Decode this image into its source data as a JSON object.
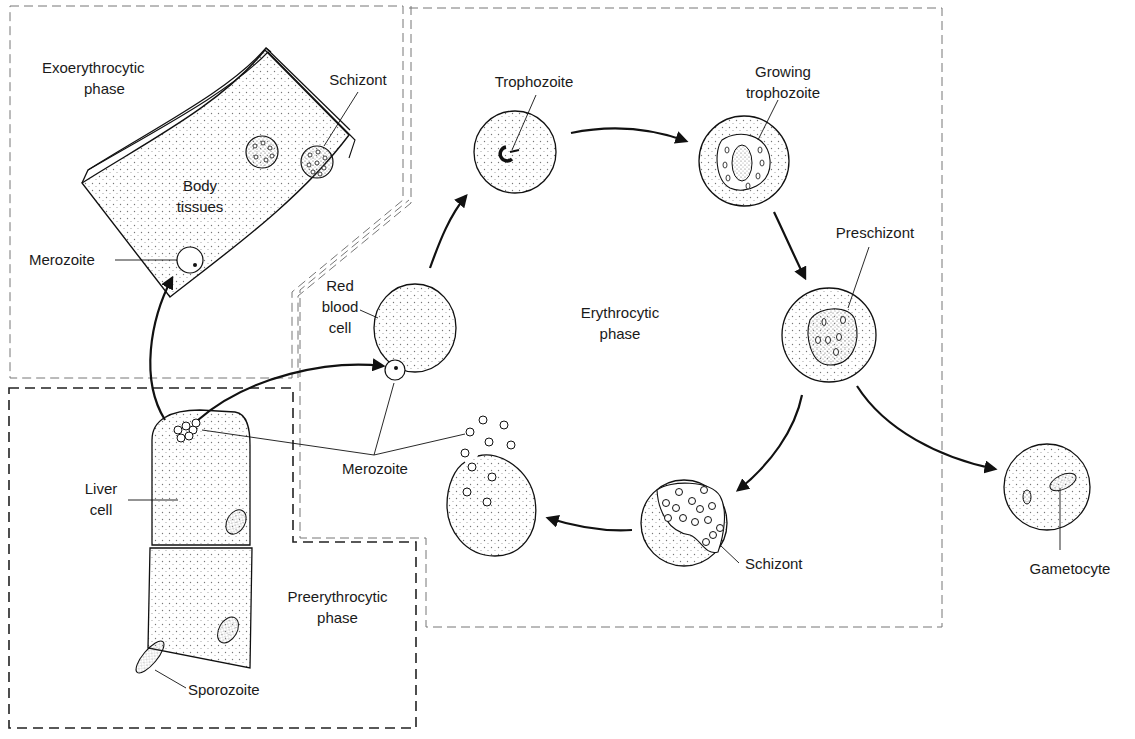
{
  "diagram": {
    "colors": {
      "ink": "#1a1a1a",
      "dashed_border": "#555555",
      "stipple": "#8a8a8a",
      "background": "#ffffff"
    },
    "regions": {
      "exoerythrocytic": {
        "line1": "Exoerythrocytic",
        "line2": "phase"
      },
      "preerythrocytic": {
        "line1": "Preerythrocytic",
        "line2": "phase"
      },
      "erythrocytic": {
        "line1": "Erythrocytic",
        "line2": "phase"
      }
    },
    "labels": {
      "schizont_tissue": "Schizont",
      "body_tissues_1": "Body",
      "body_tissues_2": "tissues",
      "merozoite_tissue": "Merozoite",
      "liver_cell_1": "Liver",
      "liver_cell_2": "cell",
      "sporozoite": "Sporozoite",
      "red_blood_cell_1": "Red",
      "red_blood_cell_2": "blood",
      "red_blood_cell_3": "cell",
      "merozoite_shared": "Merozoite",
      "trophozoite": "Trophozoite",
      "growing_trophozoite_1": "Growing",
      "growing_trophozoite_2": "trophozoite",
      "preschizont": "Preschizont",
      "schizont_blood": "Schizont",
      "gametocyte": "Gametocyte"
    },
    "stages": [
      "Sporozoite",
      "Liver cell",
      "Merozoite",
      "Red blood cell",
      "Trophozoite",
      "Growing trophozoite",
      "Preschizont",
      "Schizont",
      "Merozoite",
      "Gametocyte"
    ]
  }
}
